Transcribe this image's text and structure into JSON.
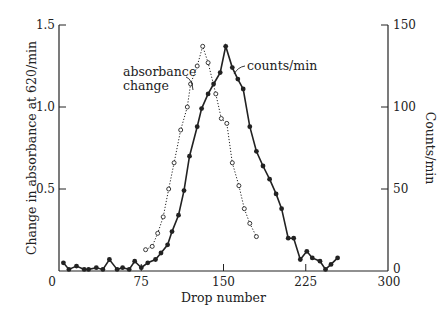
{
  "chart_data": {
    "type": "line",
    "title": "",
    "xlabel": "Drop number",
    "ylabel": "Change in absorbance at 620/min",
    "ylabel_right": "Counts/min",
    "xlim": [
      0,
      300
    ],
    "ylim": [
      0,
      1.5
    ],
    "ylim_right": [
      0,
      150
    ],
    "xticks": [
      "0",
      "75",
      "150",
      "225",
      "300"
    ],
    "yticks": [
      "0.5",
      "1.0",
      "1.5"
    ],
    "yticks_right": [
      "0",
      "50",
      "100",
      "150"
    ],
    "grid": false,
    "annotations": [
      "absorbance change",
      "counts/min"
    ],
    "series": [
      {
        "name": "counts/min",
        "axis": "right",
        "style": "solid line, filled circles",
        "x": [
          4,
          9,
          16,
          23,
          27,
          34,
          40,
          46,
          53,
          58,
          64,
          69,
          75,
          81,
          88,
          93,
          99,
          103,
          109,
          114,
          119,
          126,
          130,
          136,
          141,
          147,
          152,
          158,
          163,
          168,
          174,
          180,
          186,
          192,
          198,
          203,
          209,
          214,
          220,
          226,
          231,
          238,
          243,
          248,
          254
        ],
        "values": [
          5,
          1,
          3,
          1,
          1,
          2,
          1,
          7,
          1,
          2,
          1,
          6,
          2,
          5,
          7,
          11,
          16,
          24,
          34,
          49,
          70,
          88,
          99,
          108,
          114,
          121,
          137,
          124,
          117,
          111,
          88,
          73,
          64,
          56,
          47,
          38,
          20,
          20,
          7,
          12,
          8,
          6,
          1,
          4,
          8
        ]
      },
      {
        "name": "absorbance change",
        "axis": "left",
        "style": "dotted line, open circles",
        "x": [
          79,
          85,
          90,
          95,
          100,
          105,
          111,
          117,
          120,
          126,
          131,
          136,
          143,
          148,
          153,
          158,
          164,
          169,
          174,
          180
        ],
        "values": [
          0.13,
          0.15,
          0.23,
          0.33,
          0.5,
          0.66,
          0.86,
          1.0,
          1.14,
          1.25,
          1.37,
          1.27,
          1.08,
          0.93,
          0.9,
          0.66,
          0.52,
          0.38,
          0.29,
          0.21
        ]
      }
    ]
  },
  "labels": {
    "x_axis_title": "Drop number",
    "y_axis_left_title": "Change in absorbance at 620/min",
    "y_axis_right_title": "Counts/min",
    "annotation_absorbance_line1": "absorbance",
    "annotation_absorbance_line2": "change",
    "annotation_counts": "counts/min",
    "x_ticks": [
      "0",
      "75",
      "150",
      "225",
      "300"
    ],
    "y_left_ticks": [
      "0.5",
      "1.0",
      "1.5"
    ],
    "y_right_ticks": [
      "0",
      "50",
      "100",
      "150"
    ]
  },
  "colors": {
    "ink": "#222222",
    "background": "#ffffff"
  }
}
